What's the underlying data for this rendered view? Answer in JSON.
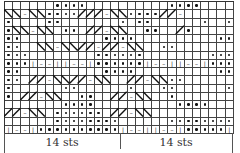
{
  "chart": {
    "columns": 28,
    "rows": 16,
    "repeat_width": 14,
    "symbols": {
      ".": "blank (knit)",
      "o": "purl dot",
      "|": "vertical bar",
      "-": "dash",
      "/": "cable right",
      "\\": "cable left"
    },
    "grid": [
      "......oooo..........oooo....",
      "\\\\-\\\\oooo///-\\\\oooo//-",
      "o....oo.......o.oo......o..o",
      "o\\\\-\\\\.oo.//-\\\\..oo../o",
      "oo..........oooo..........oo",
      "oo..\\\\-\\\\//-//-\\\\..oo",
      "ooo........oooooo........ooo",
      "ooo|--||--|oooooo|--||--|ooo",
      "oo..........oooo..........oo",
      "oo.//-\\\\//-\\\\..//-\\\\oo",
      "o......oo......o...oo......o",
      "o.//-\\\\..oo..//-\\\\..o",
      ".......oooo..........oooo...",
      "//-\\\\.oooooo.//-\\\\....",
      "......oooooooo......oooooooo",
      "|--|oooooooooo|--||--|ooooo|"
    ],
    "labels": [
      "14 sts",
      "14 sts"
    ]
  }
}
